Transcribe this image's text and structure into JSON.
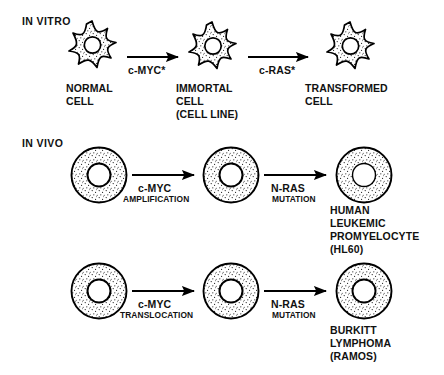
{
  "figure": {
    "title_in_vitro": "IN VITRO",
    "title_in_vivo": "IN VIVO",
    "background_color": "#ffffff",
    "ink_color": "#000000"
  },
  "rows": [
    {
      "id": "in-vitro",
      "section_label": "IN VITRO",
      "cell_shape": "star",
      "cells": [
        {
          "id": "normal-cell",
          "label_lines": [
            "NORMAL",
            "CELL"
          ]
        },
        {
          "id": "immortal-cell",
          "label_lines": [
            "IMMORTAL",
            "CELL",
            "(CELL LINE)"
          ]
        },
        {
          "id": "transformed-cell",
          "label_lines": [
            "TRANSFORMED",
            "CELL"
          ]
        }
      ],
      "arrows": [
        {
          "id": "arrow-cmyc-star",
          "gene": "c-MYC*",
          "event": ""
        },
        {
          "id": "arrow-cras-star",
          "gene": "c-RAS*",
          "event": ""
        }
      ]
    },
    {
      "id": "in-vivo-hl60",
      "section_label": "IN VIVO",
      "cell_shape": "round",
      "cells": [
        {
          "id": "normal-round-cell-1",
          "label_lines": []
        },
        {
          "id": "amplified-cell",
          "label_lines": []
        },
        {
          "id": "hl60-cell",
          "label_lines": [
            "HUMAN",
            "LEUKEMIC",
            "PROMYELOCYTE",
            "(HL60)"
          ]
        }
      ],
      "arrows": [
        {
          "id": "arrow-cmyc-amplification",
          "gene": "c-MYC",
          "event": "AMPLIFICATION"
        },
        {
          "id": "arrow-nras-mutation-1",
          "gene": "N-RAS",
          "event": "MUTATION"
        }
      ]
    },
    {
      "id": "in-vivo-ramos",
      "section_label": "",
      "cell_shape": "round",
      "cells": [
        {
          "id": "normal-round-cell-2",
          "label_lines": []
        },
        {
          "id": "translocated-cell",
          "label_lines": []
        },
        {
          "id": "ramos-cell",
          "label_lines": [
            "BURKITT",
            "LYMPHOMA",
            "(RAMOS)"
          ]
        }
      ],
      "arrows": [
        {
          "id": "arrow-cmyc-translocation",
          "gene": "c-MYC",
          "event": "TRANSLOCATION"
        },
        {
          "id": "arrow-nras-mutation-2",
          "gene": "N-RAS",
          "event": "MUTATION"
        }
      ]
    }
  ],
  "labels": {
    "in_vitro": "IN VITRO",
    "in_vivo": "IN VIVO",
    "normal_cell_l1": "NORMAL",
    "normal_cell_l2": "CELL",
    "immortal_cell_l1": "IMMORTAL",
    "immortal_cell_l2": "CELL",
    "immortal_cell_l3": "(CELL LINE)",
    "transformed_cell_l1": "TRANSFORMED",
    "transformed_cell_l2": "CELL",
    "cmyc_star": "c-MYC*",
    "cras_star": "c-RAS*",
    "cmyc_1": "c-MYC",
    "amplification": "AMPLIFICATION",
    "nras_1": "N-RAS",
    "mutation_1": "MUTATION",
    "hl60_l1": "HUMAN",
    "hl60_l2": "LEUKEMIC",
    "hl60_l3": "PROMYELOCYTE",
    "hl60_l4": "(HL60)",
    "cmyc_2": "c-MYC",
    "translocation": "TRANSLOCATION",
    "nras_2": "N-RAS",
    "mutation_2": "MUTATION",
    "ramos_l1": "BURKITT",
    "ramos_l2": "LYMPHOMA",
    "ramos_l3": "(RAMOS)"
  }
}
